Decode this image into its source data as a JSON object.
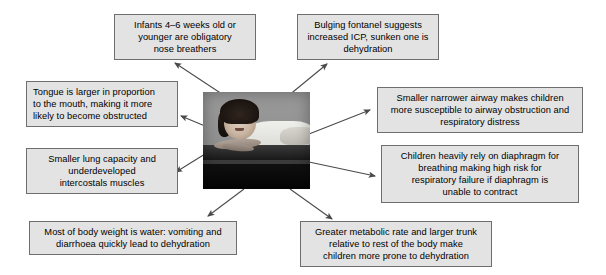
{
  "diagram": {
    "title_semantic": "anatomical-and-physiological-differences-in-children",
    "center": {
      "type": "photograph",
      "alt": "Grayscale photograph of a young child lying prone on a table"
    },
    "boxes": [
      {
        "id": "nose-breathers",
        "align": "center",
        "lines": [
          "Infants 4–6 weeks old or",
          "younger are obligatory",
          "nose breathers"
        ]
      },
      {
        "id": "fontanel",
        "align": "center",
        "lines": [
          "Bulging fontanel suggests",
          "increased ICP, sunken one is",
          "dehydration"
        ]
      },
      {
        "id": "tongue",
        "align": "left",
        "lines": [
          "Tongue is larger in proportion",
          "to the mouth, making it more",
          "likely to become obstructed"
        ]
      },
      {
        "id": "airway",
        "align": "center",
        "lines": [
          "Smaller narrower airway makes children",
          "more susceptible to airway obstruction and",
          "respiratory distress"
        ]
      },
      {
        "id": "lung-capacity",
        "align": "center",
        "lines": [
          "Smaller lung capacity and",
          "underdeveloped",
          "intercostals muscles"
        ]
      },
      {
        "id": "diaphragm",
        "align": "center",
        "lines": [
          "Children heavily rely on diaphragm for",
          "breathing making high risk for",
          "respiratory failure if diaphragm is",
          "unable to contract"
        ]
      },
      {
        "id": "body-water",
        "align": "center",
        "lines": [
          "Most of body weight is water: vomiting and",
          "diarrhoea quickly lead to dehydration"
        ]
      },
      {
        "id": "metabolic-rate",
        "align": "center",
        "lines": [
          "Greater metabolic rate and larger trunk",
          "relative to rest of the body make",
          "children more prone to dehydration"
        ]
      }
    ],
    "colors": {
      "box_fill": "#e3e3e3",
      "box_border": "#6e6e6e",
      "text": "#000000",
      "arrow": "#4a4a4a",
      "background": "#ffffff"
    }
  }
}
